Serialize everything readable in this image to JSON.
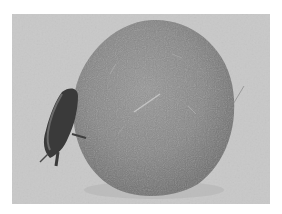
{
  "image": {
    "description": "Grayscale photograph of a dung beetle pushing a large dung ball across a light sandy surface",
    "subjects": [
      {
        "name": "dung-ball",
        "shape": "roughly spherical, textured with fibrous strands",
        "position": "center-right"
      },
      {
        "name": "dung-beetle",
        "shape": "dark beetle clinging to the left side of the ball",
        "position": "left"
      }
    ],
    "colors": {
      "background": "#c8c8c8",
      "ball": "#8a8a8a",
      "ball_shadow": "#6e6e6e",
      "ball_highlight": "#a5a5a5",
      "beetle": "#3a3a3a",
      "beetle_highlight": "#6a6a6a",
      "border": "#ffffff"
    }
  }
}
